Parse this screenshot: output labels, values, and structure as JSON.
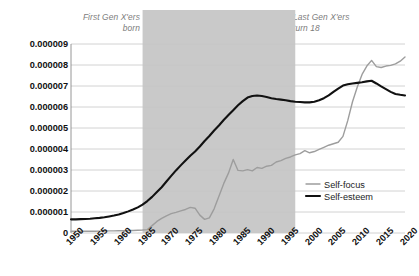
{
  "chart_data": {
    "type": "line",
    "title": "",
    "subtitle": "",
    "xlabel": "",
    "ylabel": "",
    "xlim": [
      1950,
      2020
    ],
    "ylim": [
      0,
      9e-06
    ],
    "grid": true,
    "legend_position": "right-middle",
    "y_tick_labels": [
      "0.000009",
      "0.000008",
      "0.000007",
      "0.000006",
      "0.000005",
      "0.000004",
      "0.000003",
      "0.000002",
      "0.000001",
      "0"
    ],
    "y_tick_values": [
      9e-06,
      8e-06,
      7e-06,
      6e-06,
      5e-06,
      4e-06,
      3e-06,
      2e-06,
      1e-06,
      0
    ],
    "x_tick_labels": [
      "1950",
      "1955",
      "1960",
      "1965",
      "1970",
      "1975",
      "1980",
      "1985",
      "1990",
      "1995",
      "2000",
      "2005",
      "2010",
      "2015",
      "2020"
    ],
    "x_tick_values": [
      1950,
      1955,
      1960,
      1965,
      1970,
      1975,
      1980,
      1985,
      1990,
      1995,
      2000,
      2005,
      2010,
      2015,
      2020
    ],
    "annotations": [
      {
        "name": "first-gen-x-born",
        "text": "First Gen X'ers\nborn",
        "align": "right",
        "color": "#7b7b7b",
        "x_year": 1965
      },
      {
        "name": "last-gen-x-turn-18",
        "text": "Last Gen X'ers\nturn 18",
        "align": "left",
        "color": "#7b7b7b",
        "x_year": 1997
      }
    ],
    "shaded_band": {
      "name": "gen-x-band",
      "x_start": 1965,
      "x_end": 1997,
      "color": "#c9c9c9"
    },
    "series": [
      {
        "name": "Self-focus",
        "color": "#9d9d9d",
        "width": 1.4,
        "x": [
          1950,
          1951,
          1952,
          1953,
          1954,
          1955,
          1956,
          1957,
          1958,
          1959,
          1960,
          1961,
          1962,
          1963,
          1964,
          1965,
          1966,
          1967,
          1968,
          1969,
          1970,
          1971,
          1972,
          1973,
          1974,
          1975,
          1976,
          1977,
          1978,
          1979,
          1980,
          1981,
          1982,
          1983,
          1984,
          1985,
          1986,
          1987,
          1988,
          1989,
          1990,
          1991,
          1992,
          1993,
          1994,
          1995,
          1996,
          1997,
          1998,
          1999,
          2000,
          2001,
          2002,
          2003,
          2004,
          2005,
          2006,
          2007,
          2008,
          2009,
          2010,
          2011,
          2012,
          2013,
          2014,
          2015,
          2016,
          2017,
          2018,
          2019,
          2020
        ],
        "y": [
          8e-08,
          8e-08,
          8e-08,
          8e-08,
          8e-08,
          8e-08,
          9e-08,
          9e-08,
          1e-07,
          1e-07,
          1.1e-07,
          1.1e-07,
          1.2e-07,
          1.2e-07,
          1.3e-07,
          1.4e-07,
          1.6e-07,
          3.5e-07,
          5.5e-07,
          7e-07,
          8.2e-07,
          9.2e-07,
          9.8e-07,
          1.05e-06,
          1.12e-06,
          1.22e-06,
          1.18e-06,
          8.5e-07,
          6.5e-07,
          7.2e-07,
          1.15e-06,
          1.75e-06,
          2.35e-06,
          2.85e-06,
          3.5e-06,
          2.98e-06,
          2.96e-06,
          3.02e-06,
          2.96e-06,
          3.12e-06,
          3.08e-06,
          3.18e-06,
          3.22e-06,
          3.38e-06,
          3.45e-06,
          3.55e-06,
          3.62e-06,
          3.72e-06,
          3.78e-06,
          3.92e-06,
          3.82e-06,
          3.88e-06,
          3.98e-06,
          4.08e-06,
          4.18e-06,
          4.25e-06,
          4.32e-06,
          4.6e-06,
          5.35e-06,
          6.25e-06,
          6.95e-06,
          7.55e-06,
          7.95e-06,
          8.22e-06,
          7.92e-06,
          7.88e-06,
          7.95e-06,
          7.98e-06,
          8.05e-06,
          8.18e-06,
          8.38e-06
        ]
      },
      {
        "name": "Self-esteem",
        "color": "#111111",
        "width": 2.1,
        "x": [
          1950,
          1951,
          1952,
          1953,
          1954,
          1955,
          1956,
          1957,
          1958,
          1959,
          1960,
          1961,
          1962,
          1963,
          1964,
          1965,
          1966,
          1967,
          1968,
          1969,
          1970,
          1971,
          1972,
          1973,
          1974,
          1975,
          1976,
          1977,
          1978,
          1979,
          1980,
          1981,
          1982,
          1983,
          1984,
          1985,
          1986,
          1987,
          1988,
          1989,
          1990,
          1991,
          1992,
          1993,
          1994,
          1995,
          1996,
          1997,
          1998,
          1999,
          2000,
          2001,
          2002,
          2003,
          2004,
          2005,
          2006,
          2007,
          2008,
          2009,
          2010,
          2011,
          2012,
          2013,
          2014,
          2015,
          2016,
          2017,
          2018,
          2019,
          2020
        ],
        "y": [
          6.5e-07,
          6.5e-07,
          6.6e-07,
          6.7e-07,
          6.8e-07,
          7e-07,
          7.2e-07,
          7.5e-07,
          7.9e-07,
          8.3e-07,
          8.8e-07,
          9.5e-07,
          1.03e-06,
          1.12e-06,
          1.22e-06,
          1.35e-06,
          1.52e-06,
          1.72e-06,
          1.95e-06,
          2.18e-06,
          2.45e-06,
          2.72e-06,
          2.98e-06,
          3.22e-06,
          3.45e-06,
          3.68e-06,
          3.88e-06,
          4.12e-06,
          4.38e-06,
          4.62e-06,
          4.88e-06,
          5.12e-06,
          5.38e-06,
          5.62e-06,
          5.85e-06,
          6.08e-06,
          6.28e-06,
          6.45e-06,
          6.52e-06,
          6.55e-06,
          6.52e-06,
          6.48e-06,
          6.42e-06,
          6.38e-06,
          6.35e-06,
          6.32e-06,
          6.28e-06,
          6.25e-06,
          6.24e-06,
          6.22e-06,
          6.22e-06,
          6.25e-06,
          6.32e-06,
          6.42e-06,
          6.55e-06,
          6.72e-06,
          6.88e-06,
          7.02e-06,
          7.08e-06,
          7.12e-06,
          7.15e-06,
          7.18e-06,
          7.22e-06,
          7.25e-06,
          7.12e-06,
          6.98e-06,
          6.85e-06,
          6.72e-06,
          6.62e-06,
          6.58e-06,
          6.55e-06
        ]
      }
    ],
    "legend": [
      {
        "label": "Self-focus",
        "color": "#9d9d9d",
        "width": 1.4
      },
      {
        "label": "Self-esteem",
        "color": "#111111",
        "width": 2.1
      }
    ]
  },
  "plot": {
    "left": 71,
    "right": 405,
    "top": 44,
    "bottom": 233,
    "grid_color": "#c6c6c6",
    "axis_color": "#8a8a8a",
    "background": "#ffffff"
  }
}
